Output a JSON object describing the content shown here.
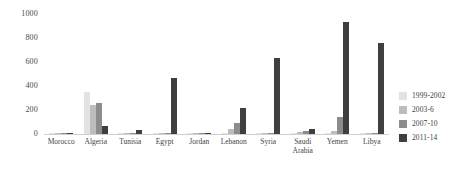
{
  "chart_data": {
    "type": "bar",
    "title": "",
    "subtitle": "",
    "xlabel": "",
    "ylabel": "",
    "ylim": [
      0,
      1000
    ],
    "yticks": [
      0,
      200,
      400,
      600,
      800,
      1000
    ],
    "ytick_labels": [
      "0",
      "200",
      "400",
      "600",
      "800",
      "1000"
    ],
    "grid": false,
    "legend_position": "right",
    "categories": [
      "Morocco",
      "Algeria",
      "Tunisia",
      "Egypt",
      "Jordan",
      "Lebanon",
      "Syria",
      "Saudi\nArabia",
      "Yemen",
      "Libya"
    ],
    "series": [
      {
        "name": "1999-2002",
        "color": "#e3e3e3",
        "values": [
          4,
          350,
          2,
          6,
          3,
          5,
          4,
          6,
          10,
          5
        ]
      },
      {
        "name": "2003-6",
        "color": "#bdbdbd",
        "values": [
          6,
          245,
          4,
          5,
          6,
          40,
          5,
          18,
          25,
          6
        ]
      },
      {
        "name": "2007-10",
        "color": "#8c8c8c",
        "values": [
          8,
          255,
          8,
          8,
          10,
          95,
          6,
          22,
          140,
          8
        ]
      },
      {
        "name": "2011-14",
        "color": "#3f3f3f",
        "values": [
          10,
          70,
          35,
          465,
          12,
          215,
          630,
          40,
          930,
          760
        ]
      }
    ]
  },
  "legend": {
    "items": [
      {
        "label": "1999-2002",
        "color": "#e3e3e3"
      },
      {
        "label": "2003-6",
        "color": "#bdbdbd"
      },
      {
        "label": "2007-10",
        "color": "#8c8c8c"
      },
      {
        "label": "2011-14",
        "color": "#3f3f3f"
      }
    ]
  },
  "colors": {
    "background": "#ffffff",
    "axis": "#d0d0d0",
    "text": "#434343"
  }
}
